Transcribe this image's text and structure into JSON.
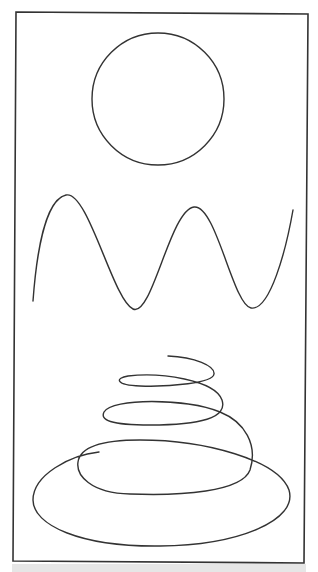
{
  "figure": {
    "background": "#ffffff",
    "stroke_color": "#333333",
    "frame": {
      "points": "16,12 308,14 304,563 13,561",
      "stroke_width": 1.6
    },
    "shapes": [
      {
        "name": "circle",
        "type": "circle",
        "cx": 158,
        "cy": 99,
        "r": 66
      },
      {
        "name": "sine-wave",
        "type": "path",
        "d": "M33,301 C36,260 44,200 66,195 C88,190 113,300 133,309 C152,318 170,210 194,207 C216,204 233,305 251,308 C270,311 286,250 293,210"
      },
      {
        "name": "spiral",
        "type": "path",
        "d": "M168,356 C195,357 215,366 214,374 C213,383 170,387 140,386 C115,385 115,378 128,376 C160,372 215,380 222,400 C228,418 200,425 150,425 C110,425 100,420 104,412 C112,398 185,398 220,412 C245,422 258,445 250,470 C242,492 180,496 130,494 C90,493 76,475 78,462 C80,448 100,440 140,440 C205,440 278,460 289,490 C298,520 240,545 160,546 C80,547 33,525 33,500 C33,475 70,455 99,452"
      }
    ],
    "caption": ""
  }
}
